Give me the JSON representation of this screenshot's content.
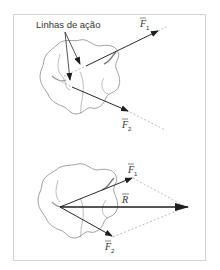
{
  "figure": {
    "top_panel": {
      "annotation": "Linhas de ação",
      "vector_1": {
        "symbol": "F",
        "subscript": "1"
      },
      "vector_2": {
        "symbol": "F",
        "subscript": "2"
      }
    },
    "bottom_panel": {
      "vector_1": {
        "symbol": "F",
        "subscript": "1"
      },
      "vector_2": {
        "symbol": "F",
        "subscript": "2"
      },
      "resultant": {
        "symbol": "R"
      }
    },
    "colors": {
      "line": "#2a2a2a",
      "blob": "#8a8a8a",
      "dashed": "#aaaaaa",
      "frame": "#d4d4d4"
    }
  }
}
